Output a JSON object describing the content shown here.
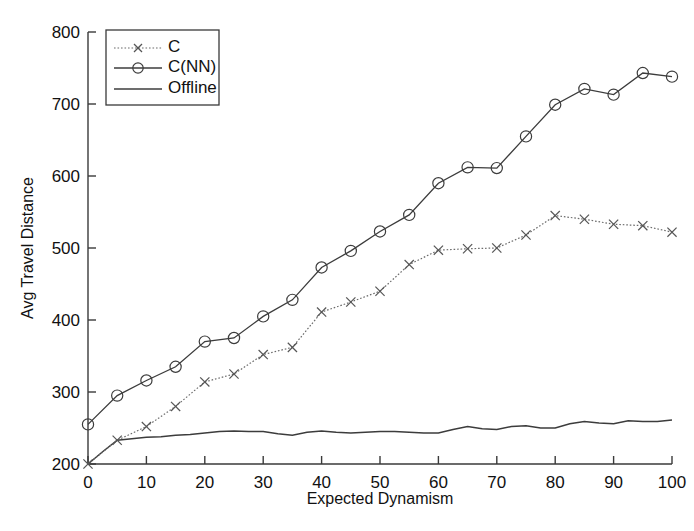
{
  "chart_data": {
    "type": "line",
    "title": "",
    "xlabel": "Expected Dynamism",
    "ylabel": "Avg Travel Distance",
    "xlim": [
      0,
      100
    ],
    "ylim": [
      200,
      800
    ],
    "xticks": [
      0,
      10,
      20,
      30,
      40,
      50,
      60,
      70,
      80,
      90,
      100
    ],
    "yticks": [
      200,
      300,
      400,
      500,
      600,
      700,
      800
    ],
    "xtick_labels": [
      "0",
      "10",
      "20",
      "30",
      "40",
      "50",
      "60",
      "70",
      "80",
      "90",
      "100"
    ],
    "ytick_labels": [
      "200",
      "300",
      "400",
      "500",
      "600",
      "700",
      "800"
    ],
    "grid": false,
    "legend_position": "upper-left",
    "x": [
      0,
      5,
      10,
      15,
      20,
      25,
      30,
      35,
      40,
      45,
      50,
      55,
      60,
      65,
      70,
      75,
      80,
      85,
      90,
      95,
      100
    ],
    "series": [
      {
        "name": "C",
        "marker": "x",
        "linestyle": "dotted",
        "values": [
          200,
          233,
          252,
          280,
          314,
          325,
          352,
          362,
          411,
          425,
          440,
          477,
          497,
          499,
          500,
          518,
          545,
          540,
          533,
          531,
          522
        ]
      },
      {
        "name": "C(NN)",
        "marker": "o",
        "linestyle": "solid",
        "values": [
          255,
          295,
          316,
          335,
          370,
          375,
          405,
          428,
          473,
          496,
          523,
          546,
          590,
          612,
          611,
          655,
          699,
          721,
          713,
          743,
          738
        ]
      },
      {
        "name": "Offline",
        "marker": "none",
        "linestyle": "solid",
        "values": [
          200,
          233,
          237,
          240,
          243,
          246,
          245,
          240,
          246,
          243,
          245,
          244,
          243,
          252,
          248,
          253,
          250,
          259,
          256,
          259,
          261
        ]
      }
    ],
    "offline_detail_x": [
      0,
      2.5,
      5,
      7.5,
      10,
      12.5,
      15,
      17.5,
      20,
      22.5,
      25,
      27.5,
      30,
      32.5,
      35,
      37.5,
      40,
      42.5,
      45,
      47.5,
      50,
      52.5,
      55,
      57.5,
      60,
      62.5,
      65,
      67.5,
      70,
      72.5,
      75,
      77.5,
      80,
      82.5,
      85,
      87.5,
      90,
      92.5,
      95,
      97.5,
      100
    ],
    "offline_detail_y": [
      200,
      217,
      233,
      235,
      237,
      238,
      240,
      241,
      243,
      245,
      246,
      245,
      245,
      242,
      240,
      244,
      246,
      244,
      243,
      244,
      245,
      245,
      244,
      243,
      243,
      248,
      252,
      249,
      248,
      252,
      253,
      250,
      250,
      256,
      259,
      257,
      256,
      260,
      259,
      259,
      261
    ]
  },
  "legend": {
    "entries": [
      {
        "label": "C"
      },
      {
        "label": "C(NN)"
      },
      {
        "label": "Offline"
      }
    ]
  },
  "colors": {
    "axis": "#3a3a3a",
    "series_c": "#6b6b6b",
    "series_cnn": "#3c3c3c",
    "series_offline": "#3c3c3c",
    "background": "#ffffff"
  }
}
